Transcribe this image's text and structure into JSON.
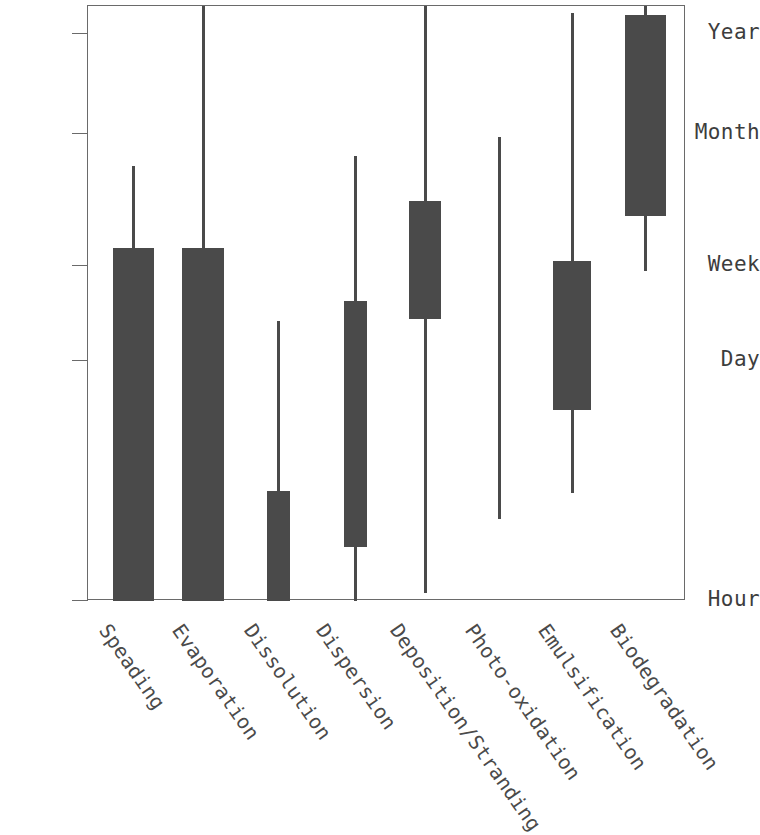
{
  "chart_data": {
    "type": "bar",
    "title": "",
    "subtitle": "",
    "xlabel": "",
    "ylabel": "",
    "grid": false,
    "legend": "none",
    "y_axis": {
      "scale": "log-time",
      "tick_labels": [
        "Year",
        "Month",
        "Week",
        "Day",
        "Hour"
      ],
      "tick_pixels": [
        33,
        133,
        265,
        360,
        600
      ],
      "top": "Year+",
      "bottom": "Hour"
    },
    "categories": [
      "Speading",
      "Evaporation",
      "Dissolution",
      "Dispersion",
      "Deposition/Stranding",
      "Photo-oxidation",
      "Emulsification",
      "Biodegradation"
    ],
    "series": [
      {
        "name": "Typical duration range (box)",
        "values": [
          {
            "category": "Speading",
            "box_top": "Week",
            "box_bottom": "Hour"
          },
          {
            "category": "Evaporation",
            "box_top": "Week",
            "box_bottom": "Hour"
          },
          {
            "category": "Dissolution",
            "box_top": "half-Day",
            "box_bottom": "Hour"
          },
          {
            "category": "Dispersion",
            "box_top": "Day-Week",
            "box_bottom": "sub-Day"
          },
          {
            "category": "Deposition/Stranding",
            "box_top": "Week-Month",
            "box_bottom": "Week"
          },
          {
            "category": "Photo-oxidation",
            "box_top": null,
            "box_bottom": null
          },
          {
            "category": "Emulsification",
            "box_top": "Week",
            "box_bottom": "sub-Day"
          },
          {
            "category": "Biodegradation",
            "box_top": "Year+",
            "box_bottom": "Week-Month"
          }
        ]
      },
      {
        "name": "Full extent range (whisker)",
        "values": [
          {
            "category": "Speading",
            "whisker_top": "below Month",
            "whisker_bottom": "Hour"
          },
          {
            "category": "Evaporation",
            "whisker_top": "above Year",
            "whisker_bottom": "Hour"
          },
          {
            "category": "Dissolution",
            "whisker_top": "near Day",
            "whisker_bottom": "Hour"
          },
          {
            "category": "Dispersion",
            "whisker_top": "below Month",
            "whisker_bottom": "Hour"
          },
          {
            "category": "Deposition/Stranding",
            "whisker_top": "above Year",
            "whisker_bottom": "Hour"
          },
          {
            "category": "Photo-oxidation",
            "whisker_top": "Month",
            "whisker_bottom": "sub-Day"
          },
          {
            "category": "Emulsification",
            "whisker_top": "above Year",
            "whisker_bottom": "sub-Day"
          },
          {
            "category": "Biodegradation",
            "whisker_top": "above Year",
            "whisker_bottom": "Week"
          }
        ]
      }
    ],
    "marks": [
      {
        "category": "Speading",
        "x_center": 132.5,
        "box_left": 112,
        "box_width": 41,
        "box_top": 247,
        "box_bottom": 600,
        "whisker_top": 165,
        "whisker_bottom": 600
      },
      {
        "category": "Evaporation",
        "x_center": 202.0,
        "box_left": 181,
        "box_width": 42,
        "box_top": 247,
        "box_bottom": 600,
        "whisker_top": 5,
        "whisker_bottom": 600
      },
      {
        "category": "Dissolution",
        "x_center": 277.0,
        "box_left": 266,
        "box_width": 23,
        "box_top": 490,
        "box_bottom": 600,
        "whisker_top": 320,
        "whisker_bottom": 600
      },
      {
        "category": "Dispersion",
        "x_center": 354.5,
        "box_left": 343,
        "box_width": 23,
        "box_top": 300,
        "box_bottom": 546,
        "whisker_top": 155,
        "whisker_bottom": 600
      },
      {
        "category": "Deposition/Stranding",
        "x_center": 424.0,
        "box_left": 408,
        "box_width": 32,
        "box_top": 200,
        "box_bottom": 318,
        "whisker_top": 5,
        "whisker_bottom": 592
      },
      {
        "category": "Photo-oxidation",
        "x_center": 498.5,
        "box_left": null,
        "box_width": 0,
        "box_top": null,
        "box_bottom": null,
        "whisker_top": 136,
        "whisker_bottom": 518
      },
      {
        "category": "Emulsification",
        "x_center": 571.0,
        "box_left": 552,
        "box_width": 38,
        "box_top": 260,
        "box_bottom": 409,
        "whisker_top": 12,
        "whisker_bottom": 492
      },
      {
        "category": "Biodegradation",
        "x_center": 644.0,
        "box_left": 624,
        "box_width": 41,
        "box_top": 14,
        "box_bottom": 215,
        "whisker_top": 5,
        "whisker_bottom": 270
      }
    ]
  },
  "axis": {
    "y_ticks": [
      {
        "label": "Year",
        "y": 33
      },
      {
        "label": "Month",
        "y": 133
      },
      {
        "label": "Week",
        "y": 265
      },
      {
        "label": "Day",
        "y": 360
      },
      {
        "label": "Hour",
        "y": 600
      }
    ]
  },
  "x_labels": [
    {
      "text": "Speading",
      "x": 113
    },
    {
      "text": "Evaporation",
      "x": 186
    },
    {
      "text": "Dissolution",
      "x": 258
    },
    {
      "text": "Dispersion",
      "x": 330
    },
    {
      "text": "Deposition/Stranding",
      "x": 404
    },
    {
      "text": "Photo-oxidation",
      "x": 479
    },
    {
      "text": "Emulsification",
      "x": 552
    },
    {
      "text": "Biodegradation",
      "x": 624
    }
  ],
  "colors": {
    "mark": "#4a4a4a",
    "axis": "#6a6a6a",
    "text": "#3d3d3d",
    "background": "#ffffff"
  }
}
